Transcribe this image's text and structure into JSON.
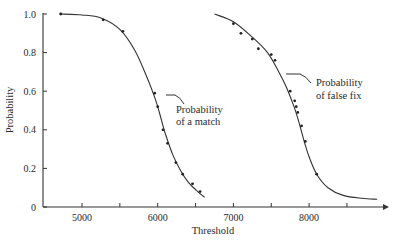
{
  "chart_data": {
    "type": "line",
    "title": "",
    "xlabel": "Threshold",
    "ylabel": "Probability",
    "xlim": [
      4500,
      9000
    ],
    "ylim": [
      0,
      1.0
    ],
    "x_ticks": [
      5000,
      5500,
      6000,
      6500,
      7000,
      7500,
      8000,
      8500
    ],
    "x_tick_labels": [
      "5000",
      "",
      "6000",
      "",
      "7000",
      "",
      "8000",
      ""
    ],
    "y_ticks": [
      0,
      0.2,
      0.4,
      0.6,
      0.8,
      1.0
    ],
    "y_tick_labels": [
      "0",
      "0.2",
      "0.4",
      "0.6",
      "0.8",
      "1.0"
    ],
    "grid": false,
    "legend": null,
    "series": [
      {
        "name": "Probability of a match",
        "annotation": [
          "Probability",
          "of a match"
        ],
        "curve": {
          "x": [
            4700,
            5000,
            5250,
            5500,
            5700,
            5850,
            5950,
            6000,
            6050,
            6100,
            6200,
            6300,
            6400,
            6500,
            6620
          ],
          "y": [
            1.0,
            0.995,
            0.98,
            0.92,
            0.81,
            0.68,
            0.58,
            0.52,
            0.45,
            0.38,
            0.27,
            0.19,
            0.13,
            0.09,
            0.05
          ]
        },
        "points": {
          "x": [
            4720,
            5280,
            5540,
            5960,
            6000,
            6070,
            6130,
            6240,
            6330,
            6460,
            6560
          ],
          "y": [
            1.0,
            0.97,
            0.91,
            0.59,
            0.52,
            0.4,
            0.33,
            0.23,
            0.17,
            0.12,
            0.08
          ]
        }
      },
      {
        "name": "Probability of false fix",
        "annotation": [
          "Probability",
          "of false fix"
        ],
        "curve": {
          "x": [
            6750,
            7000,
            7250,
            7450,
            7600,
            7700,
            7800,
            7850,
            7900,
            7950,
            8000,
            8100,
            8250,
            8450,
            8700,
            8900
          ],
          "y": [
            1.0,
            0.96,
            0.88,
            0.8,
            0.7,
            0.62,
            0.52,
            0.46,
            0.39,
            0.32,
            0.26,
            0.17,
            0.1,
            0.06,
            0.045,
            0.04
          ]
        },
        "points": {
          "x": [
            7000,
            7100,
            7250,
            7330,
            7500,
            7550,
            7750,
            7810,
            7830,
            7850,
            7900,
            7950,
            8100
          ],
          "y": [
            0.95,
            0.9,
            0.87,
            0.82,
            0.79,
            0.76,
            0.6,
            0.55,
            0.52,
            0.49,
            0.42,
            0.34,
            0.17
          ]
        }
      }
    ]
  }
}
